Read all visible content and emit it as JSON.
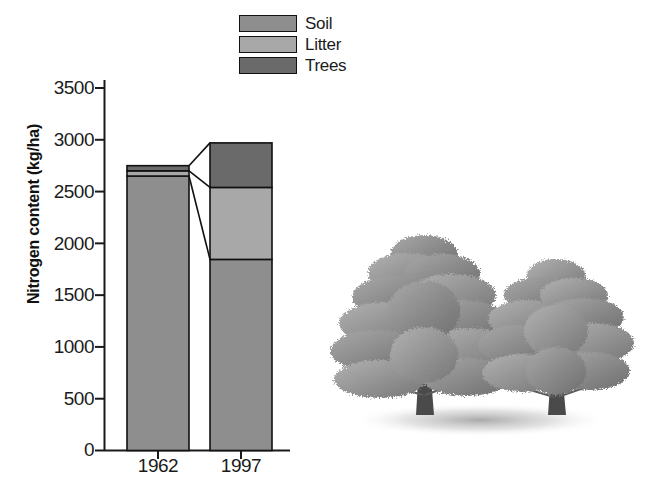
{
  "chart_data": {
    "type": "bar",
    "stacked": true,
    "title": "",
    "xlabel": "",
    "ylabel": "Nitrogen content (kg/ha)",
    "categories": [
      "1962",
      "1997"
    ],
    "series": [
      {
        "name": "Soil",
        "color": "#8e8e8e",
        "values": [
          2650,
          1845
        ]
      },
      {
        "name": "Litter",
        "color": "#a8a8a8",
        "values": [
          50,
          695
        ]
      },
      {
        "name": "Trees",
        "color": "#6a6a6a",
        "values": [
          50,
          430
        ]
      }
    ],
    "totals": [
      2750,
      2970
    ],
    "ylim": [
      0,
      3500
    ],
    "yticks": [
      3500,
      3000,
      2500,
      2000,
      1500,
      1000,
      500,
      0
    ],
    "ytick_labels": [
      "3500",
      "3000",
      "2500",
      "2000",
      "1500",
      "1000",
      "500",
      "0"
    ],
    "grid": false,
    "legend_position": "top-center",
    "connectors": [
      {
        "from_value": 2750,
        "to_value": 2970
      },
      {
        "from_value": 2700,
        "to_value": 2540
      },
      {
        "from_value": 2650,
        "to_value": 1845
      }
    ]
  },
  "legend": {
    "items": [
      {
        "label": "Soil",
        "color": "#8e8e8e"
      },
      {
        "label": "Litter",
        "color": "#a8a8a8"
      },
      {
        "label": "Trees",
        "color": "#6a6a6a"
      }
    ]
  },
  "axis": {
    "y_title": "Nitrogen content (kg/ha)",
    "y_labels": [
      "3500",
      "3000",
      "2500",
      "2000",
      "1500",
      "1000",
      "500",
      "0"
    ],
    "x_labels": [
      "1962",
      "1997"
    ]
  },
  "illustration": {
    "name": "two-conifer-trees",
    "description": "Two grayscale pine trees with ground shadow"
  },
  "colors": {
    "soil": "#8e8e8e",
    "litter": "#a8a8a8",
    "trees": "#6a6a6a",
    "axis": "#1a1a1a",
    "background": "#ffffff"
  }
}
